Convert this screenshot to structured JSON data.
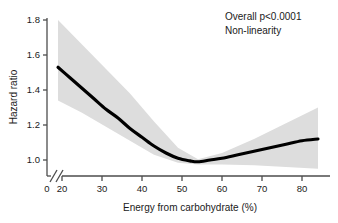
{
  "chart_data": {
    "type": "line",
    "title": "",
    "xlabel": "Energy from carbohydrate (%)",
    "ylabel": "Hazard ratio",
    "xlim": [
      18,
      85
    ],
    "ylim": [
      0.9,
      1.85
    ],
    "grid": false,
    "legend_position": "none",
    "axis_break": {
      "present": true,
      "between": [
        0,
        20
      ],
      "axis": "x"
    },
    "x_ticks": [
      "0",
      "20",
      "30",
      "40",
      "50",
      "60",
      "70",
      "80"
    ],
    "x_tick_values": [
      0,
      20,
      30,
      40,
      50,
      60,
      70,
      80
    ],
    "y_ticks": [
      "1.0",
      "1.2",
      "1.4",
      "1.6",
      "1.8"
    ],
    "y_tick_values": [
      1.0,
      1.2,
      1.4,
      1.6,
      1.8
    ],
    "reference_value": 1.0,
    "series": [
      {
        "name": "Hazard ratio",
        "color": "#000000",
        "x": [
          19,
          22,
          25,
          28,
          31,
          34,
          37,
          40,
          43,
          46,
          49,
          52,
          54,
          57,
          60,
          64,
          68,
          72,
          76,
          80,
          84
        ],
        "values": [
          1.53,
          1.47,
          1.41,
          1.35,
          1.29,
          1.24,
          1.18,
          1.13,
          1.08,
          1.04,
          1.01,
          0.995,
          0.99,
          1.0,
          1.01,
          1.03,
          1.05,
          1.07,
          1.09,
          1.11,
          1.12
        ]
      },
      {
        "name": "95% confidence interval lower",
        "color": "#dddddd",
        "x": [
          19,
          25,
          31,
          37,
          43,
          49,
          54,
          60,
          68,
          76,
          84
        ],
        "values": [
          1.34,
          1.27,
          1.19,
          1.11,
          1.03,
          0.985,
          0.975,
          0.975,
          0.97,
          0.96,
          0.95
        ]
      },
      {
        "name": "95% confidence interval upper",
        "color": "#dddddd",
        "x": [
          19,
          25,
          31,
          37,
          43,
          49,
          54,
          60,
          68,
          76,
          84
        ],
        "values": [
          1.8,
          1.66,
          1.52,
          1.38,
          1.22,
          1.07,
          1.005,
          1.04,
          1.12,
          1.21,
          1.3
        ]
      }
    ],
    "annotations": [
      {
        "name": "overall-p-value",
        "text": "Overall p<0.0001"
      },
      {
        "name": "non-linearity",
        "text": "Non-linearity"
      }
    ]
  },
  "axes": {
    "y_label": "Hazard ratio",
    "x_label": "Energy from carbohydrate (%)",
    "y_tick_labels": [
      "1.8",
      "1.6",
      "1.4",
      "1.2",
      "1.0"
    ],
    "x_tick_labels": [
      "0",
      "20",
      "30",
      "40",
      "50",
      "60",
      "70",
      "80"
    ]
  },
  "annotations": {
    "line1": "Overall p<0.0001",
    "line2": "Non-linearity"
  },
  "colors": {
    "background": "#ffffff",
    "curve": "#000000",
    "band": "#dddddd",
    "axis": "#4d4d4d",
    "text": "#1a1a1a"
  }
}
